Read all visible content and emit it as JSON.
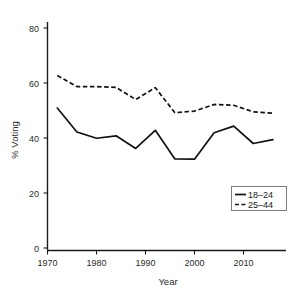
{
  "chart_data": {
    "type": "line",
    "title": "",
    "xlabel": "Year",
    "ylabel": "% Voting",
    "xlim": [
      1970,
      2018
    ],
    "ylim": [
      0,
      85
    ],
    "xticks": [
      1970,
      1980,
      1990,
      2000,
      2010
    ],
    "yticks": [
      0,
      20,
      40,
      60,
      80
    ],
    "grid": false,
    "legend_position": "lower right",
    "x": [
      1972,
      1976,
      1980,
      1984,
      1988,
      1992,
      1996,
      2000,
      2004,
      2008,
      2012,
      2016
    ],
    "series": [
      {
        "name": "18-24",
        "style": "solid",
        "values": [
          50.9,
          42.2,
          39.9,
          40.8,
          36.2,
          42.8,
          32.4,
          32.3,
          41.9,
          44.3,
          38.0,
          39.4
        ]
      },
      {
        "name": "25-44",
        "style": "dashed",
        "values": [
          62.7,
          58.7,
          58.7,
          58.4,
          54.0,
          58.3,
          49.2,
          49.8,
          52.2,
          51.9,
          49.5,
          49.0
        ]
      }
    ]
  },
  "axes": {
    "x_tick_labels": [
      "1970",
      "1980",
      "1990",
      "2000",
      "2010"
    ],
    "y_tick_labels": [
      "0",
      "20",
      "40",
      "60",
      "80"
    ],
    "x_axis_title": "Year",
    "y_axis_title": "% Voting"
  },
  "legend": {
    "entries": [
      {
        "label": "18–24",
        "style": "solid"
      },
      {
        "label": "25–44",
        "style": "dashed"
      }
    ]
  }
}
